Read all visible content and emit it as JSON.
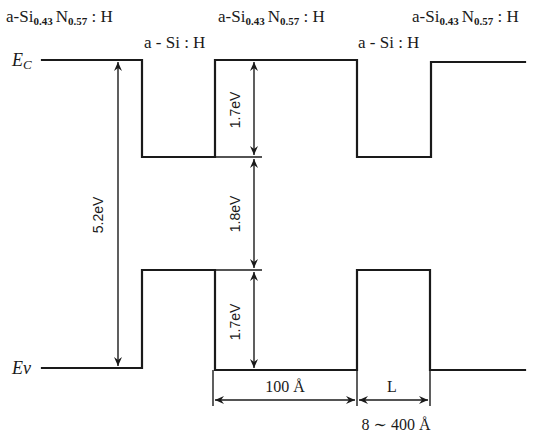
{
  "diagram": {
    "type": "energy-band-diagram",
    "layers": {
      "barrier_left": {
        "prefix": "a-Si",
        "sub1": "0.43",
        "mid": "N",
        "sub2": "0.57",
        "suffix": " : H"
      },
      "barrier_mid": {
        "prefix": "a-Si",
        "sub1": "0.43",
        "mid": "N",
        "sub2": "0.57",
        "suffix": " : H"
      },
      "barrier_right": {
        "prefix": "a-Si",
        "sub1": "0.43",
        "mid": "N",
        "sub2": "0.57",
        "suffix": " : H"
      },
      "well_left": "a - Si : H",
      "well_right": "a - Si : H"
    },
    "band_labels": {
      "conduction": {
        "main": "E",
        "sub": "C"
      },
      "valence": {
        "main": "Ev"
      }
    },
    "energies": {
      "barrier_gap": "5.2eV",
      "conduction_offset": "1.7eV",
      "well_gap": "1.8eV",
      "valence_offset": "1.7eV"
    },
    "dimensions": {
      "barrier_width": "100 Å",
      "well_width_label": "L",
      "well_width_range": "8 ∼ 400 Å"
    }
  }
}
